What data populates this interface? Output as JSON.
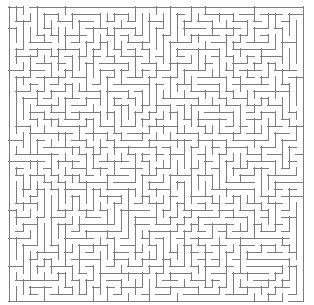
{
  "app": {
    "title": "Maze",
    "background_color": "#ffffff"
  },
  "maze": {
    "label": "maze-grid",
    "type": "perfect-maze",
    "algorithm": "randomized-depth-first-search",
    "seed": 20240517,
    "columns": 42,
    "rows": 42,
    "cell_size_px": 7,
    "wall_thickness_px": 1,
    "wall_color": "#7d7d7d",
    "border_color": "#6f6f6f",
    "passage_color": "#ffffff",
    "origin_x_px": 9,
    "origin_y_px": 7,
    "width_px": 294,
    "height_px": 294,
    "entrance": {
      "label": "entrance",
      "edge": "top",
      "cell_column": 2,
      "cell_row": 0
    },
    "exit": {
      "label": "exit",
      "edge": "bottom",
      "cell_column": 39,
      "cell_row": 41
    }
  }
}
